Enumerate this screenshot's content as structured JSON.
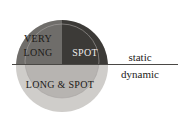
{
  "diagram": {
    "type": "venn-quadrant-diagram",
    "regions": [
      {
        "id": "very-long",
        "label": "VERY LONG",
        "line1": "VERY",
        "line2": "LONG",
        "color": "#6f6d6b"
      },
      {
        "id": "spot",
        "label": "SPOT",
        "color": "#3b3936"
      },
      {
        "id": "long-and-spot",
        "label": "LONG & SPOT",
        "color": "#b6b3b0"
      }
    ],
    "outer_circle_color": "#cdcbc8",
    "axis": {
      "divider_label_top": "static",
      "divider_label_bottom": "dynamic",
      "line_color": "#4a4845"
    },
    "background_color": "#ffffff"
  }
}
